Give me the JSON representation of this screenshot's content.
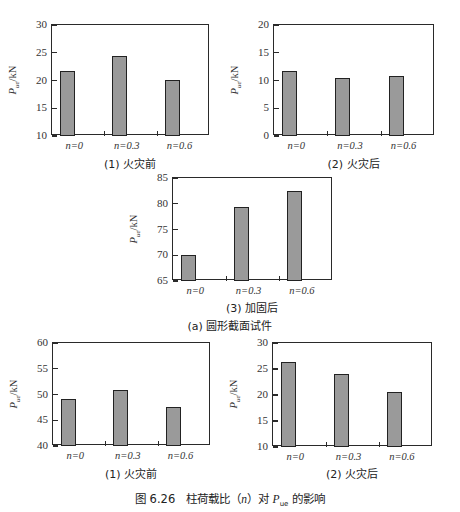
{
  "figure_caption": {
    "number": "图 6.26",
    "text_before": "柱荷载比（",
    "var_n": "n",
    "text_mid": "）对 ",
    "var_P": "P",
    "var_P_sub": "ue",
    "text_after": " 的影响"
  },
  "group_caption_a": "(a) 圆形截面试件",
  "chart_data": [
    {
      "type": "bar",
      "id": "chart1",
      "title": "(1) 火灾前",
      "categories": [
        "n=0",
        "n=0.3",
        "n=0.6"
      ],
      "values": [
        21.7,
        24.5,
        20.1
      ],
      "ylabel": "P_ue/kN",
      "yticks": [
        10,
        15,
        20,
        25,
        30
      ],
      "ylim": [
        10,
        30
      ],
      "grid": false
    },
    {
      "type": "bar",
      "id": "chart2",
      "title": "(2) 火灾后",
      "categories": [
        "n=0",
        "n=0.3",
        "n=0.6"
      ],
      "values": [
        11.7,
        10.5,
        10.8
      ],
      "ylabel": "P_ue/kN",
      "yticks": [
        0,
        5,
        10,
        15,
        20
      ],
      "ylim": [
        0,
        20
      ],
      "grid": false
    },
    {
      "type": "bar",
      "id": "chart3",
      "title": "(3) 加固后",
      "categories": [
        "n=0",
        "n=0.3",
        "n=0.6"
      ],
      "values": [
        70.1,
        79.4,
        82.4
      ],
      "ylabel": "P_ue/kN",
      "yticks": [
        65,
        70,
        75,
        80,
        85
      ],
      "ylim": [
        65,
        85
      ],
      "grid": false
    },
    {
      "type": "bar",
      "id": "chart4",
      "title": "(1) 火灾前",
      "categories": [
        "n=0",
        "n=0.3",
        "n=0.6"
      ],
      "values": [
        49.1,
        50.8,
        47.6
      ],
      "ylabel": "P_ue/kN",
      "yticks": [
        40,
        45,
        50,
        55,
        60
      ],
      "ylim": [
        40,
        60
      ],
      "grid": false
    },
    {
      "type": "bar",
      "id": "chart5",
      "title": "(2) 火灾后",
      "categories": [
        "n=0",
        "n=0.3",
        "n=0.6"
      ],
      "values": [
        26.4,
        24.0,
        20.6
      ],
      "ylabel": "P_ue/kN",
      "yticks": [
        10,
        15,
        20,
        25,
        30
      ],
      "ylim": [
        10,
        30
      ],
      "grid": false
    }
  ],
  "layout": {
    "frames": [
      {
        "left": 51,
        "top": 24,
        "width": 158,
        "height": 111,
        "subcap_top": 155
      },
      {
        "left": 273,
        "top": 24,
        "width": 161,
        "height": 111,
        "subcap_top": 155
      },
      {
        "left": 172,
        "top": 177,
        "width": 160,
        "height": 103,
        "subcap_top": 299
      },
      {
        "left": 52,
        "top": 342,
        "width": 158,
        "height": 103,
        "subcap_top": 465
      },
      {
        "left": 272,
        "top": 342,
        "width": 160,
        "height": 104,
        "subcap_top": 465
      }
    ],
    "bar_color": "#9a9a9a",
    "edge_color": "#222222"
  }
}
